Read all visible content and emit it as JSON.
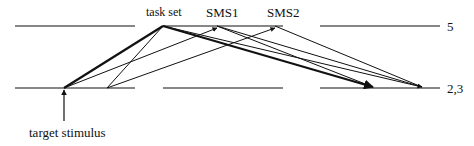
{
  "diagram": {
    "labels": {
      "task_set": "task set",
      "sms1": "SMS1",
      "sms2": "SMS2",
      "level_top": "5",
      "level_bottom": "2,3",
      "target_stimulus": "target stimulus"
    },
    "colors": {
      "line": "#111111",
      "background": "#ffffff"
    },
    "levels": [
      {
        "id": "top",
        "y": 26,
        "segments": [
          [
            15,
            135
          ],
          [
            163,
            283
          ],
          [
            320,
            440
          ]
        ],
        "label": "5"
      },
      {
        "id": "bottom",
        "y": 88,
        "segments": [
          [
            15,
            135
          ],
          [
            163,
            283
          ],
          [
            320,
            440
          ]
        ],
        "label": "2,3"
      }
    ],
    "nodes": {
      "target": [
        64,
        88
      ],
      "mid_bottom": [
        107,
        88
      ],
      "task_set": [
        163,
        26
      ],
      "sms1": [
        217,
        27
      ],
      "sms2": [
        275,
        27
      ],
      "out1": [
        373,
        88
      ],
      "out2": [
        422,
        88
      ]
    },
    "edges": [
      {
        "from": "target",
        "to": "task_set",
        "weight": "thick",
        "arrow": false
      },
      {
        "from": "task_set",
        "to": "mid_bottom",
        "weight": "thin",
        "arrow": false
      },
      {
        "from": "target",
        "to": "sms1",
        "weight": "thin",
        "arrow": true
      },
      {
        "from": "mid_bottom",
        "to": "sms2",
        "weight": "thin",
        "arrow": true
      },
      {
        "from": "task_set",
        "to": "out1",
        "weight": "thick",
        "arrow": true
      },
      {
        "from": "task_set",
        "to": "out2",
        "weight": "thin",
        "arrow": true
      },
      {
        "from": "sms1",
        "to": "out1",
        "weight": "thin",
        "arrow": true
      },
      {
        "from": "sms1",
        "to": "out2",
        "weight": "thin",
        "arrow": true
      },
      {
        "from": "sms2",
        "to": "out2",
        "weight": "thin",
        "arrow": true
      }
    ]
  }
}
